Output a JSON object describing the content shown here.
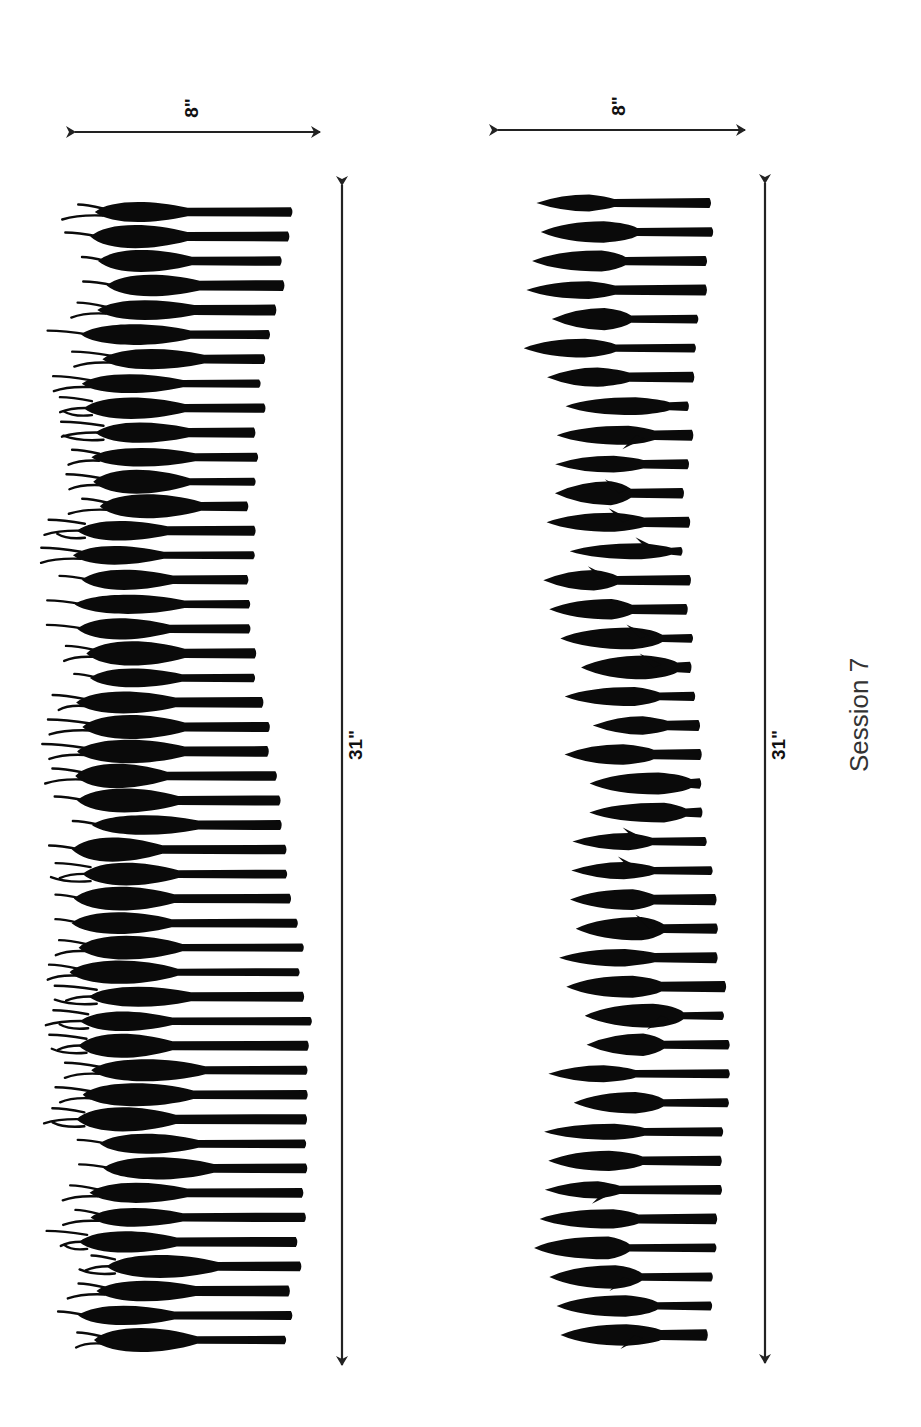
{
  "caption": "Session 7",
  "panels": [
    {
      "id": "panel-1",
      "style": "feathered",
      "width_label": "8\"",
      "length_label": "31\"",
      "width_arrow": {
        "x1": 75,
        "x2": 320,
        "y": 132
      },
      "length_arrow": {
        "x": 342,
        "y1": 185,
        "y2": 1365
      },
      "width_label_pos": {
        "x": 198,
        "y": 108
      },
      "length_label_pos": {
        "x": 362,
        "y": 745
      },
      "count": 47,
      "y_start": 212,
      "y_end": 1340
    },
    {
      "id": "panel-2",
      "style": "spear",
      "width_label": "8\"",
      "length_label": "31\"",
      "width_arrow": {
        "x1": 498,
        "x2": 745,
        "y": 130
      },
      "length_arrow": {
        "x": 765,
        "y1": 183,
        "y2": 1363
      },
      "width_label_pos": {
        "x": 625,
        "y": 106
      },
      "length_label_pos": {
        "x": 785,
        "y": 745
      },
      "count": 40,
      "y_start": 203,
      "y_end": 1335
    }
  ],
  "caption_pos": {
    "x": 868,
    "y": 715
  }
}
